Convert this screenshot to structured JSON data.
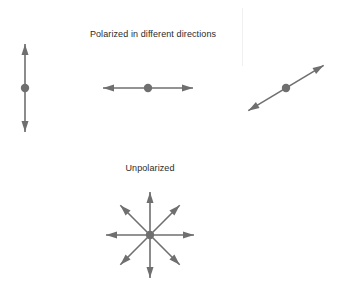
{
  "figure": {
    "width": 338,
    "height": 285,
    "background_color": "#ffffff",
    "stroke_color": "#6f6f6f",
    "text_color": "#2b2b2b"
  },
  "captions": {
    "polarized": "Polarized in different directions",
    "unpolarized": "Unpolarized"
  },
  "diagram": {
    "polarized_group": {
      "label": "Polarized in different directions",
      "arrows": [
        {
          "name": "vertical-polarization-arrow",
          "orientation": "vertical",
          "angle_degrees": 90,
          "center": [
            25,
            88
          ],
          "half_length": 44,
          "double_headed": true,
          "dot": true
        },
        {
          "name": "horizontal-polarization-arrow",
          "orientation": "horizontal",
          "angle_degrees": 0,
          "center": [
            148,
            88
          ],
          "half_length": 45,
          "double_headed": true,
          "dot": true
        },
        {
          "name": "diagonal-polarization-arrow",
          "orientation": "diagonal",
          "angle_degrees": 31,
          "center": [
            286,
            88
          ],
          "half_length": 44,
          "double_headed": true,
          "dot": true
        }
      ]
    },
    "unpolarized_group": {
      "label": "Unpolarized",
      "center": [
        150,
        235
      ],
      "dot": true,
      "arrows": [
        {
          "name": "unpolarized-arrow-0deg",
          "angle_degrees": 0,
          "half_length": 44,
          "double_headed": true
        },
        {
          "name": "unpolarized-arrow-45deg",
          "angle_degrees": 45,
          "half_length": 42,
          "double_headed": true
        },
        {
          "name": "unpolarized-arrow-90deg",
          "angle_degrees": 90,
          "half_length": 43,
          "double_headed": true
        },
        {
          "name": "unpolarized-arrow-135deg",
          "angle_degrees": 135,
          "half_length": 42,
          "double_headed": true
        }
      ]
    }
  },
  "artifacts": {
    "vertical_streak": "faint-light-gray-vertical-line"
  }
}
